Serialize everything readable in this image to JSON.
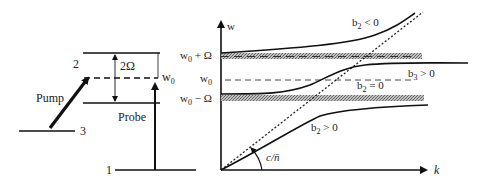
{
  "energy_diagram": {
    "level_labels": {
      "level1": "1",
      "level2": "2",
      "level3": "3"
    },
    "splitting_label": "2Ω",
    "w0_label": {
      "base": "w",
      "sub": "0"
    },
    "pump_label": "Pump",
    "probe_label": "Probe"
  },
  "dispersion_plot": {
    "y_axis_label": "w",
    "x_axis_label": "k",
    "y_ticks": [
      {
        "base": "w",
        "sub": "0",
        "suffix": " + Ω"
      },
      {
        "base": "w",
        "sub": "0",
        "suffix": ""
      },
      {
        "base": "w",
        "sub": "0",
        "suffix": " − Ω"
      }
    ],
    "angle_label": "c/n̄",
    "curve_labels": {
      "b2_neg": {
        "base": "b",
        "sub": "2",
        "suffix": " < 0"
      },
      "b2_zero": {
        "base": "b",
        "sub": "2",
        "suffix": " = 0"
      },
      "b3_pos": {
        "base": "b",
        "sub": "3",
        "suffix": " > 0"
      },
      "b2_pos": {
        "base": "b",
        "sub": "2",
        "suffix": " > 0"
      }
    },
    "colors": {
      "line": "#111111",
      "band": "#8a8a8a"
    }
  }
}
